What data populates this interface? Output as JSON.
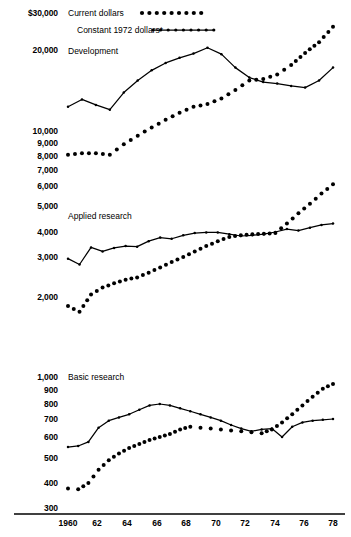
{
  "legend": {
    "items": [
      {
        "label": "Current dollars",
        "marker": "dotted-dots"
      },
      {
        "label": "Constant 1972 dollars*",
        "marker": "line-with-dots"
      }
    ]
  },
  "panels": [
    {
      "name": "Development",
      "label": "Development"
    },
    {
      "name": "Applied research",
      "label": "Applied research"
    },
    {
      "name": "Basic research",
      "label": "Basic research"
    }
  ],
  "y_axis": {
    "ticks": [
      {
        "label": "$30,000",
        "value": 30000,
        "y": 13
      },
      {
        "label": "20,000",
        "value": 20000,
        "y": 50
      },
      {
        "label": "10,000",
        "value": 10000,
        "y": 131
      },
      {
        "label": "9,000",
        "value": 9000,
        "y": 143
      },
      {
        "label": "8,000",
        "value": 8000,
        "y": 156
      },
      {
        "label": "7,000",
        "value": 7000,
        "y": 170
      },
      {
        "label": "6,000",
        "value": 6000,
        "y": 186
      },
      {
        "label": "5,000",
        "value": 5000,
        "y": 206
      },
      {
        "label": "4,000",
        "value": 4000,
        "y": 232
      },
      {
        "label": "3,000",
        "value": 3000,
        "y": 257
      },
      {
        "label": "2,000",
        "value": 2000,
        "y": 297
      },
      {
        "label": "1,000",
        "value": 1000,
        "y": 377
      },
      {
        "label": "900",
        "value": 900,
        "y": 390
      },
      {
        "label": "800",
        "value": 800,
        "y": 404
      },
      {
        "label": "700",
        "value": 700,
        "y": 419
      },
      {
        "label": "600",
        "value": 600,
        "y": 437
      },
      {
        "label": "500",
        "value": 500,
        "y": 458
      },
      {
        "label": "400",
        "value": 400,
        "y": 483
      },
      {
        "label": "300",
        "value": 300,
        "y": 508
      }
    ]
  },
  "x_axis": {
    "ticks": [
      {
        "label": "1960",
        "year": 1960,
        "x": 68
      },
      {
        "label": "62",
        "year": 1962,
        "x": 97
      },
      {
        "label": "64",
        "year": 1964,
        "x": 127
      },
      {
        "label": "66",
        "year": 1966,
        "x": 157
      },
      {
        "label": "68",
        "year": 1968,
        "x": 186
      },
      {
        "label": "70",
        "year": 1970,
        "x": 216
      },
      {
        "label": "72",
        "year": 1972,
        "x": 245
      },
      {
        "label": "74",
        "year": 1974,
        "x": 275
      },
      {
        "label": "76",
        "year": 1976,
        "x": 304
      },
      {
        "label": "78",
        "year": 1978,
        "x": 333
      }
    ]
  },
  "chart_data": {
    "type": "line",
    "title": "",
    "subtitle": "",
    "xlabel": "",
    "ylabel": "",
    "scale": "log",
    "grid": false,
    "legend_position": "top-left",
    "x": [
      1960,
      1961,
      1962,
      1963,
      1964,
      1965,
      1966,
      1967,
      1968,
      1969,
      1970,
      1971,
      1972,
      1973,
      1974,
      1975,
      1976,
      1977,
      1978
    ],
    "panels": [
      {
        "name": "Development",
        "ylim": [
          8000,
          30000
        ],
        "series": [
          {
            "name": "Current dollars",
            "style": "dotted",
            "values": [
              8100,
              8200,
              8200,
              8100,
              8900,
              9600,
              10300,
              11000,
              11700,
              12300,
              12600,
              13200,
              14200,
              15400,
              15600,
              16200,
              17600,
              19500,
              21800,
              25800
            ]
          },
          {
            "name": "Constant 1972 dollars*",
            "style": "line",
            "values": [
              12300,
              13100,
              12500,
              12000,
              13900,
              15400,
              16800,
              17900,
              18700,
              19400,
              20500,
              19300,
              17200,
              15800,
              15200,
              15000,
              14700,
              14500,
              15400,
              17200
            ]
          }
        ]
      },
      {
        "name": "Applied research",
        "ylim": [
          1700,
          6500
        ],
        "series": [
          {
            "name": "Current dollars",
            "style": "dotted",
            "values": [
              1850,
              1760,
              2050,
              2200,
              2300,
              2380,
              2440,
              2560,
              2700,
              2850,
              3000,
              3200,
              3400,
              3600,
              3780,
              3850,
              3900,
              3920,
              3950,
              4300,
              4700,
              5100,
              5600,
              6100
            ]
          },
          {
            "name": "Constant 1972 dollars*",
            "style": "line",
            "values": [
              2950,
              2780,
              3350,
              3200,
              3330,
              3400,
              3380,
              3600,
              3750,
              3700,
              3850,
              3950,
              3980,
              3980,
              3900,
              3820,
              3850,
              3900,
              4000,
              4100,
              4050,
              4150,
              4250,
              4300
            ]
          }
        ]
      },
      {
        "name": "Basic research",
        "ylim": [
          350,
          1000
        ],
        "series": [
          {
            "name": "Current dollars",
            "style": "dotted",
            "values": [
              375,
              372,
              400,
              450,
              490,
              520,
              545,
              565,
              585,
              600,
              615,
              640,
              655,
              650,
              645,
              640,
              635,
              630,
              625,
              620,
              640,
              680,
              730,
              790,
              850,
              910,
              945
            ]
          },
          {
            "name": "Constant 1972 dollars*",
            "style": "line",
            "values": [
              550,
              555,
              575,
              650,
              690,
              710,
              730,
              760,
              790,
              800,
              790,
              770,
              750,
              730,
              710,
              690,
              665,
              645,
              630,
              640,
              645,
              600,
              655,
              680,
              690,
              695,
              700
            ]
          }
        ]
      }
    ]
  }
}
